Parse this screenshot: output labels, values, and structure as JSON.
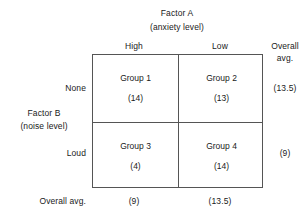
{
  "factor_a": {
    "title": "Factor A",
    "subtitle": "(anxiety level)",
    "levels": [
      "High",
      "Low"
    ]
  },
  "factor_b": {
    "title": "Factor B",
    "subtitle": "(noise level)",
    "levels": [
      "None",
      "Loud"
    ]
  },
  "margin": {
    "header_line1": "Overall",
    "header_line2": "avg.",
    "bottom_label": "Overall avg.",
    "row_values": [
      "(13.5)",
      "(9)"
    ],
    "column_values": [
      "(9)",
      "(13.5)"
    ]
  },
  "cells": [
    [
      {
        "name": "Group 1",
        "value": "(14)"
      },
      {
        "name": "Group 2",
        "value": "(13)"
      }
    ],
    [
      {
        "name": "Group 3",
        "value": "(4)"
      },
      {
        "name": "Group 4",
        "value": "(14)"
      }
    ]
  ]
}
